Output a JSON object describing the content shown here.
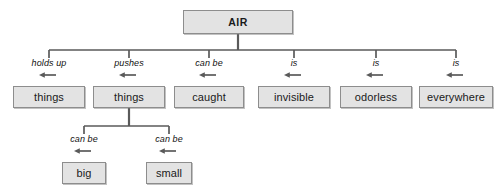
{
  "diagram": {
    "type": "concept-map",
    "title": "AIR",
    "colors": {
      "box_fill": "#e3e3e3",
      "box_border": "#8d8d8d",
      "line": "#5a5a5a",
      "text": "#1a1a1a",
      "background": "#ffffff"
    },
    "nodes": [
      {
        "id": "air",
        "label": "AIR",
        "level": 0,
        "x": 238,
        "y": 22,
        "w": 110,
        "h": 24,
        "bold": true
      },
      {
        "id": "things1",
        "label": "things",
        "level": 1,
        "x": 49,
        "y": 97,
        "w": 72,
        "h": 22,
        "bold": false
      },
      {
        "id": "things2",
        "label": "things",
        "level": 1,
        "x": 129,
        "y": 97,
        "w": 72,
        "h": 22,
        "bold": false
      },
      {
        "id": "caught",
        "label": "caught",
        "level": 1,
        "x": 209,
        "y": 97,
        "w": 70,
        "h": 22,
        "bold": false
      },
      {
        "id": "invisible",
        "label": "invisible",
        "level": 1,
        "x": 294,
        "y": 97,
        "w": 72,
        "h": 22,
        "bold": false
      },
      {
        "id": "odorless",
        "label": "odorless",
        "level": 1,
        "x": 376,
        "y": 97,
        "w": 72,
        "h": 22,
        "bold": false
      },
      {
        "id": "everywhere",
        "label": "everywhere",
        "level": 1,
        "x": 456,
        "y": 97,
        "w": 74,
        "h": 22,
        "bold": false
      },
      {
        "id": "big",
        "label": "big",
        "level": 2,
        "x": 84,
        "y": 173,
        "w": 44,
        "h": 22,
        "bold": false
      },
      {
        "id": "small",
        "label": "small",
        "level": 2,
        "x": 169,
        "y": 173,
        "w": 46,
        "h": 22,
        "bold": false
      }
    ],
    "edges": [
      {
        "from": "air",
        "to": "things1",
        "label": "holds up",
        "label_x": 49,
        "label_y": 61
      },
      {
        "from": "air",
        "to": "things2",
        "label": "pushes",
        "label_x": 129,
        "label_y": 61
      },
      {
        "from": "air",
        "to": "caught",
        "label": "can be",
        "label_x": 209,
        "label_y": 61
      },
      {
        "from": "air",
        "to": "invisible",
        "label": "is",
        "label_x": 294,
        "label_y": 61
      },
      {
        "from": "air",
        "to": "odorless",
        "label": "is",
        "label_x": 376,
        "label_y": 61
      },
      {
        "from": "air",
        "to": "everywhere",
        "label": "is",
        "label_x": 456,
        "label_y": 61
      },
      {
        "from": "things2",
        "to": "big",
        "label": "can be",
        "label_x": 84,
        "label_y": 137
      },
      {
        "from": "things2",
        "to": "small",
        "label": "can be",
        "label_x": 169,
        "label_y": 137
      }
    ],
    "edge_labels_flat": [
      "holds up",
      "pushes",
      "can be",
      "is",
      "is",
      "is",
      "can be",
      "can be"
    ]
  }
}
